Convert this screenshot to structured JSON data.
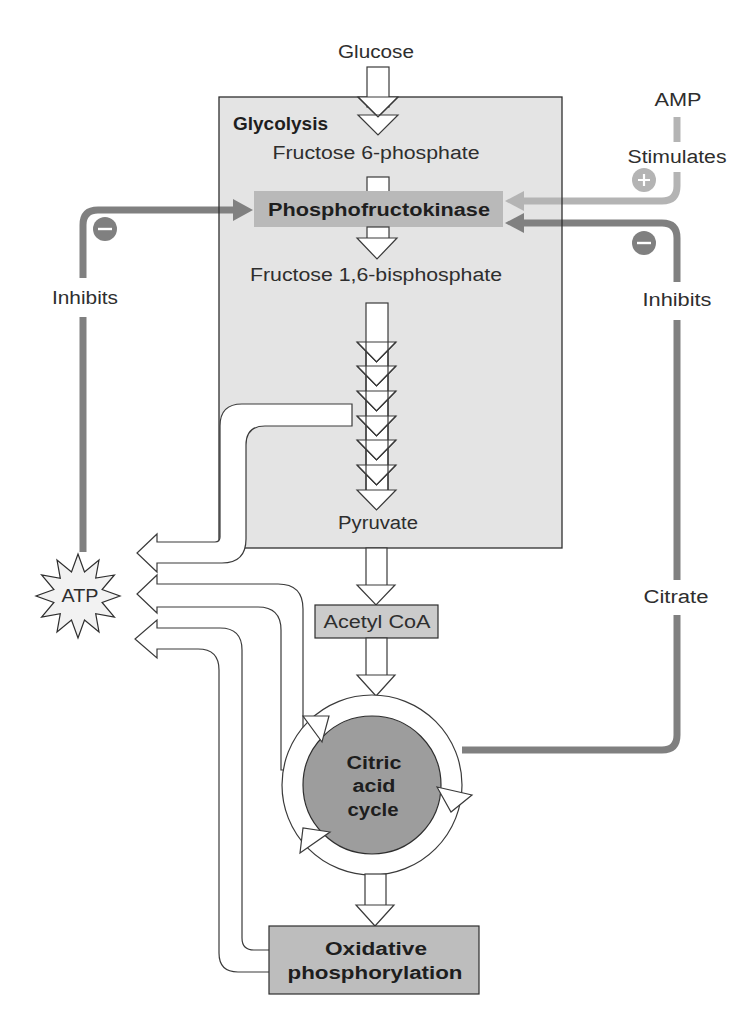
{
  "diagram": {
    "top_input": "Glucose",
    "glycolysis": {
      "label": "Glycolysis",
      "steps": [
        "Fructose 6-phosphate",
        "Phosphofructokinase",
        "Fructose 1,6-bisphosphate",
        "Pyruvate"
      ]
    },
    "acetyl_coa": "Acetyl CoA",
    "citric_acid_cycle": {
      "lines": [
        "Citric",
        "acid",
        "cycle"
      ]
    },
    "oxidative_phosphorylation": {
      "lines": [
        "Oxidative",
        "phosphorylation"
      ]
    },
    "atp": "ATP",
    "regulators": {
      "amp": {
        "name": "AMP",
        "effect": "Stimulates",
        "sign": "+"
      },
      "atp_feedback": {
        "effect": "Inhibits",
        "sign": "−"
      },
      "citrate": {
        "name": "Citrate",
        "effect": "Inhibits",
        "sign": "−"
      }
    },
    "atp_sources": [
      "Glycolysis",
      "Citric acid cycle",
      "Oxidative phosphorylation"
    ]
  },
  "colors": {
    "glycolysis_box": "#e4e4e4",
    "enzyme_band": "#b9b9b9",
    "acetyl_box": "#cbcbcb",
    "cycle_core": "#9d9d9d",
    "oxphos_box": "#bdbdbd",
    "stimulate_line": "#b4b4b4",
    "inhibit_line": "#808080",
    "atp_burst": "#f2f2f2"
  }
}
